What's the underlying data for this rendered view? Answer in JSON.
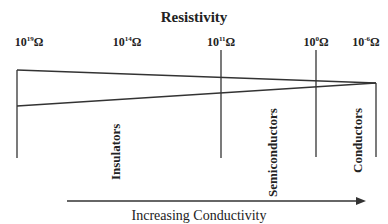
{
  "title": "Resistivity",
  "ticks": [
    {
      "base": "10",
      "exp": "19",
      "unit": "Ω",
      "x": 29
    },
    {
      "base": "10",
      "exp": "14",
      "unit": "Ω",
      "x": 127
    },
    {
      "base": "10",
      "exp": "11",
      "unit": "Ω",
      "x": 221
    },
    {
      "base": "10",
      "exp": "0",
      "unit": "Ω",
      "x": 316
    },
    {
      "base": "10",
      "exp": "-6",
      "unit": "Ω",
      "x": 368
    }
  ],
  "regions": {
    "insulators": "Insulators",
    "semiconductors": "Semiconductors",
    "conductors": "Conductors"
  },
  "arrow_label": "Increasing Conductivity",
  "colors": {
    "line": "#333333",
    "text": "#222222"
  }
}
